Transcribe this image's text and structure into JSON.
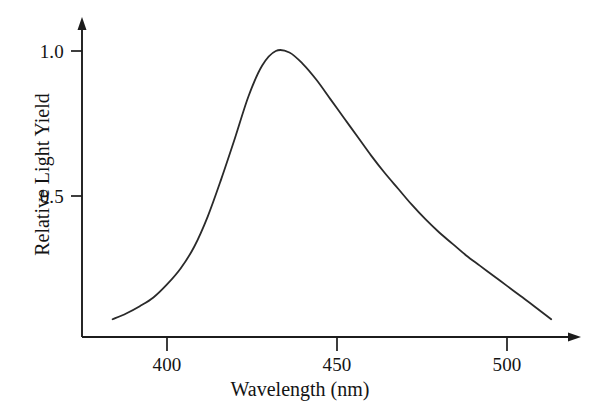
{
  "figure": {
    "name": "scintillator-emission-spectrum",
    "background_color": "#ffffff",
    "curve_color": "#2a2a2a",
    "axis_color": "#1c1c1c"
  },
  "axes": {
    "x_title": "Wavelength (nm)",
    "y_title": "Relative Light Yield",
    "x_ticks": [
      {
        "label": "400",
        "value": 400
      },
      {
        "label": "450",
        "value": 450
      },
      {
        "label": "500",
        "value": 500
      }
    ],
    "y_ticks": [
      {
        "label": "0.5",
        "value": 0.5
      },
      {
        "label": "1.0",
        "value": 1.0
      }
    ]
  },
  "chart_data": {
    "type": "line",
    "title": "",
    "subtitle": "",
    "xlabel": "Wavelength (nm)",
    "ylabel": "Relative Light Yield",
    "xlim": [
      380,
      517
    ],
    "ylim": [
      0,
      1.1
    ],
    "grid": false,
    "legend": null,
    "annotations": [],
    "x_tick_labels": [
      "400",
      "450",
      "500"
    ],
    "x_tick_values": [
      400,
      450,
      500
    ],
    "y_tick_labels": [
      "0.5",
      "1.0"
    ],
    "y_tick_values": [
      0.5,
      1.0
    ],
    "series": [
      {
        "name": "Relative Light Yield",
        "color": "#2a2a2a",
        "x": [
          384,
          388,
          392,
          396,
          400,
          404,
          408,
          412,
          416,
          420,
          424,
          428,
          432,
          436,
          440,
          444,
          448,
          452,
          456,
          460,
          464,
          468,
          472,
          476,
          480,
          484,
          488,
          492,
          496,
          500,
          504,
          508,
          513
        ],
        "values": [
          0.075,
          0.095,
          0.12,
          0.15,
          0.195,
          0.25,
          0.325,
          0.43,
          0.56,
          0.7,
          0.845,
          0.95,
          1.0,
          0.995,
          0.955,
          0.9,
          0.835,
          0.77,
          0.705,
          0.64,
          0.58,
          0.525,
          0.47,
          0.42,
          0.375,
          0.335,
          0.295,
          0.26,
          0.225,
          0.19,
          0.155,
          0.12,
          0.075
        ]
      }
    ],
    "peak": {
      "wavelength": 433,
      "value": 1.0
    }
  }
}
